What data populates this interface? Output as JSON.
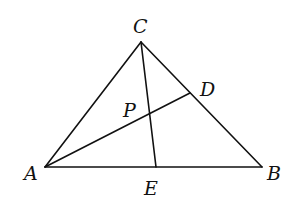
{
  "diagram": {
    "type": "triangle-with-cevians",
    "stroke_color": "#111111",
    "background": "#ffffff",
    "points": {
      "A": {
        "x": 45,
        "y": 167,
        "label": "A",
        "lx": 24,
        "ly": 180
      },
      "B": {
        "x": 262,
        "y": 167,
        "label": "B",
        "lx": 267,
        "ly": 180
      },
      "C": {
        "x": 141,
        "y": 42,
        "label": "C",
        "lx": 133,
        "ly": 33
      },
      "D": {
        "x": 190,
        "y": 93,
        "label": "D",
        "lx": 200,
        "ly": 96
      },
      "E": {
        "x": 156,
        "y": 167,
        "label": "E",
        "lx": 144,
        "ly": 195
      },
      "P": {
        "x": 149,
        "y": 113,
        "label": "P",
        "lx": 123,
        "ly": 117
      }
    },
    "segments": [
      {
        "from": "A",
        "to": "B"
      },
      {
        "from": "B",
        "to": "C"
      },
      {
        "from": "C",
        "to": "A"
      },
      {
        "from": "A",
        "to": "D"
      },
      {
        "from": "C",
        "to": "E"
      }
    ]
  }
}
